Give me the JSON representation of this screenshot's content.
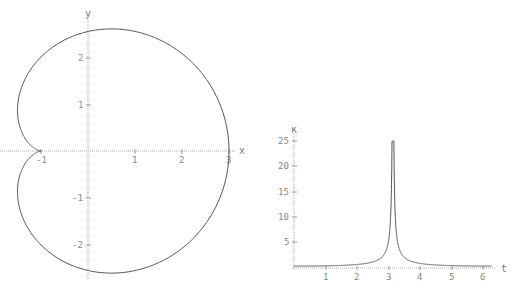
{
  "chart_data": [
    {
      "type": "line",
      "title": "",
      "subtitle": "Parametric curve x(t)=2cos t + cos 2t, y(t)=2sin t + sin 2t",
      "xlabel": "x",
      "ylabel": "y",
      "xlim": [
        -1.5,
        3.1
      ],
      "ylim": [
        -2.7,
        2.7
      ],
      "x_ticks": [
        "-1",
        "1",
        "2",
        "3"
      ],
      "y_ticks": [
        "-2",
        "-1",
        "1",
        "2"
      ],
      "grid": false,
      "legend": null,
      "series": [
        {
          "name": "curve",
          "points": [
            [
              3,
              0
            ],
            [
              2.6,
              1.3
            ],
            [
              1.5,
              2.2
            ],
            [
              0.5,
              2.6
            ],
            [
              -0.5,
              2.3
            ],
            [
              -1.1,
              1.7
            ],
            [
              -1.4,
              0.9
            ],
            [
              -1.2,
              0.3
            ],
            [
              -1,
              0
            ],
            [
              -1.2,
              -0.3
            ],
            [
              -1.4,
              -0.9
            ],
            [
              -1.1,
              -1.7
            ],
            [
              -0.5,
              -2.3
            ],
            [
              0.5,
              -2.6
            ],
            [
              1.5,
              -2.2
            ],
            [
              2.6,
              -1.3
            ],
            [
              3,
              0
            ]
          ]
        }
      ]
    },
    {
      "type": "line",
      "title": "",
      "xlabel": "t",
      "ylabel": "κ",
      "xlim": [
        0,
        6.3
      ],
      "ylim": [
        0,
        25
      ],
      "x_ticks": [
        "1",
        "2",
        "3",
        "4",
        "5",
        "6"
      ],
      "y_ticks": [
        "5",
        "10",
        "15",
        "20",
        "25"
      ],
      "grid": false,
      "legend": null,
      "series": [
        {
          "name": "curvature",
          "x": [
            0,
            1,
            2,
            2.5,
            2.9,
            3.05,
            3.14,
            3.23,
            3.38,
            3.8,
            4.3,
            5.3,
            6.28
          ],
          "values": [
            0.4,
            0.45,
            0.7,
            1.1,
            2.8,
            8,
            25,
            8,
            2.8,
            1.1,
            0.7,
            0.45,
            0.4
          ]
        }
      ]
    }
  ],
  "left_plot": {
    "xlabel": "x",
    "ylabel": "y",
    "xticks": [
      "-1",
      "1",
      "2",
      "3"
    ],
    "yticks": [
      "2",
      "1",
      "-1",
      "-2"
    ]
  },
  "right_plot": {
    "xlabel": "t",
    "ylabel": "κ",
    "xticks": [
      "1",
      "2",
      "3",
      "4",
      "5",
      "6"
    ],
    "yticks": [
      "25",
      "20",
      "15",
      "10",
      "5"
    ]
  }
}
